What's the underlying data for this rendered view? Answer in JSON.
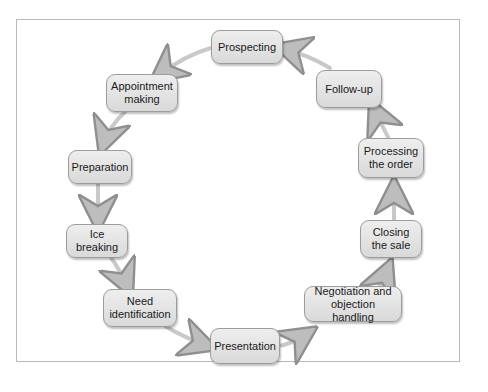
{
  "diagram": {
    "type": "cycle",
    "title": "",
    "nodes": [
      {
        "id": "prospecting",
        "label": "Prospecting"
      },
      {
        "id": "appointment",
        "label": "Appointment making"
      },
      {
        "id": "preparation",
        "label": "Preparation"
      },
      {
        "id": "ice",
        "label": "Ice breaking"
      },
      {
        "id": "need",
        "label": "Need identification"
      },
      {
        "id": "presentation",
        "label": "Presentation"
      },
      {
        "id": "negotiation",
        "label": "Negotiation and objection handling"
      },
      {
        "id": "closing",
        "label": "Closing the sale"
      },
      {
        "id": "processing",
        "label": "Processing the order"
      },
      {
        "id": "followup",
        "label": "Follow-up"
      }
    ],
    "edges": [
      [
        "prospecting",
        "appointment"
      ],
      [
        "appointment",
        "preparation"
      ],
      [
        "preparation",
        "ice"
      ],
      [
        "ice",
        "need"
      ],
      [
        "need",
        "presentation"
      ],
      [
        "presentation",
        "negotiation"
      ],
      [
        "negotiation",
        "closing"
      ],
      [
        "closing",
        "processing"
      ],
      [
        "processing",
        "followup"
      ],
      [
        "followup",
        "prospecting"
      ]
    ],
    "colors": {
      "node_fill": "#e3e3e3",
      "node_border": "#9c9c9c",
      "arrow": "#c8c8c8",
      "frame": "#b9b9b9"
    }
  }
}
